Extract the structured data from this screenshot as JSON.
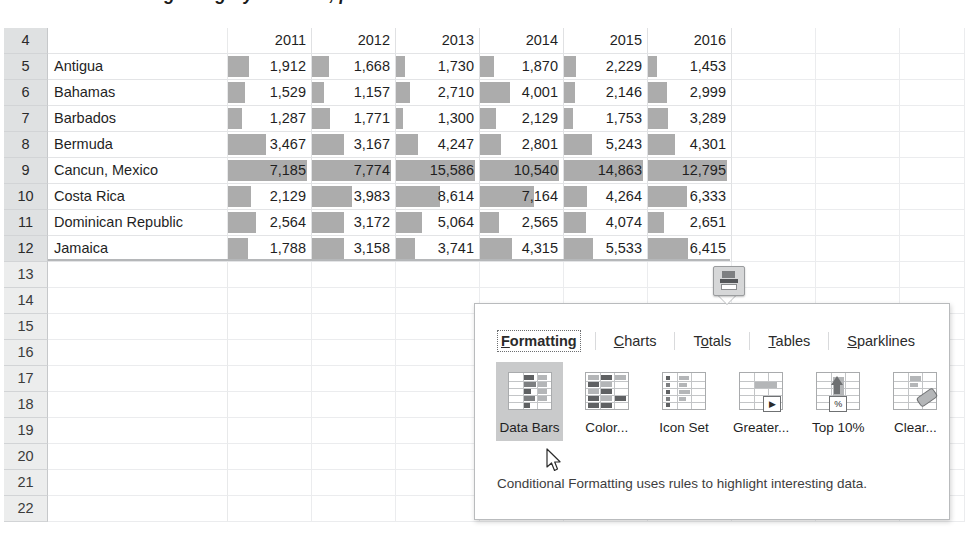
{
  "document": {
    "cut_off_heading": "With the Formatting category selected, point to the Data Bars conditional formatt"
  },
  "sheet": {
    "row_numbers": [
      "4",
      "5",
      "6",
      "7",
      "8",
      "9",
      "10",
      "11",
      "12",
      "13",
      "14",
      "15",
      "16",
      "17",
      "18",
      "19",
      "20",
      "21",
      "22"
    ],
    "selected_rows": [
      "4",
      "5",
      "6",
      "7",
      "8",
      "9",
      "10",
      "11",
      "12"
    ],
    "column_headers": [
      "2011",
      "2012",
      "2013",
      "2014",
      "2015",
      "2016"
    ],
    "blank_corner": "",
    "rows": [
      {
        "label": "Antigua",
        "values": [
          "1,912",
          "1,668",
          "1,730",
          "1,870",
          "2,229",
          "1,453"
        ]
      },
      {
        "label": "Bahamas",
        "values": [
          "1,529",
          "1,157",
          "2,710",
          "4,001",
          "2,146",
          "2,999"
        ]
      },
      {
        "label": "Barbados",
        "values": [
          "1,287",
          "1,771",
          "1,300",
          "2,129",
          "1,753",
          "3,289"
        ]
      },
      {
        "label": "Bermuda",
        "values": [
          "3,467",
          "3,167",
          "4,247",
          "2,801",
          "5,243",
          "4,301"
        ]
      },
      {
        "label": "Cancun, Mexico",
        "values": [
          "7,185",
          "7,774",
          "15,586",
          "10,540",
          "14,863",
          "12,795"
        ]
      },
      {
        "label": "Costa Rica",
        "values": [
          "2,129",
          "3,983",
          "8,614",
          "7,164",
          "4,264",
          "6,333"
        ]
      },
      {
        "label": "Dominican Republic",
        "values": [
          "2,564",
          "3,172",
          "5,064",
          "2,565",
          "4,074",
          "2,651"
        ]
      },
      {
        "label": "Jamaica",
        "values": [
          "1,788",
          "3,158",
          "3,741",
          "4,315",
          "5,533",
          "6,415"
        ]
      }
    ]
  },
  "chart_data": {
    "type": "bar",
    "xlabel": "",
    "ylabel": "",
    "categories": [
      "Antigua",
      "Bahamas",
      "Barbados",
      "Bermuda",
      "Cancun, Mexico",
      "Costa Rica",
      "Dominican Republic",
      "Jamaica"
    ],
    "series": [
      {
        "name": "2011",
        "values": [
          1912,
          1529,
          1287,
          3467,
          7185,
          2129,
          2564,
          1788
        ]
      },
      {
        "name": "2012",
        "values": [
          1668,
          1157,
          1771,
          3167,
          7774,
          3983,
          3172,
          3158
        ]
      },
      {
        "name": "2013",
        "values": [
          1730,
          2710,
          1300,
          4247,
          15586,
          8614,
          5064,
          3741
        ]
      },
      {
        "name": "2014",
        "values": [
          1870,
          4001,
          2129,
          2801,
          10540,
          7164,
          2565,
          4315
        ]
      },
      {
        "name": "2015",
        "values": [
          2229,
          2146,
          1753,
          5243,
          14863,
          4264,
          4074,
          5533
        ]
      },
      {
        "name": "2016",
        "values": [
          1453,
          2999,
          3289,
          4301,
          12795,
          6333,
          2651,
          6415
        ]
      }
    ],
    "bar_color": "#9a9a9a",
    "grid": true,
    "legend": "none"
  },
  "quick_analysis": {
    "button_icon": "quick-analysis-icon",
    "tabs": [
      {
        "label": "Formatting",
        "accel": "F",
        "active": true
      },
      {
        "label": "Charts",
        "accel": "C",
        "active": false
      },
      {
        "label": "Totals",
        "accel": "o",
        "active": false
      },
      {
        "label": "Tables",
        "accel": "T",
        "active": false
      },
      {
        "label": "Sparklines",
        "accel": "S",
        "active": false
      }
    ],
    "gallery": [
      {
        "label": "Data Bars",
        "icon": "data-bars-icon",
        "selected": true
      },
      {
        "label": "Color...",
        "icon": "color-scale-icon",
        "selected": false
      },
      {
        "label": "Icon Set",
        "icon": "icon-set-icon",
        "selected": false
      },
      {
        "label": "Greater...",
        "icon": "greater-than-icon",
        "selected": false
      },
      {
        "label": "Top 10%",
        "icon": "top-ten-percent-icon",
        "selected": false
      },
      {
        "label": "Clear...",
        "icon": "clear-format-icon",
        "selected": false
      }
    ],
    "tip": "Conditional Formatting uses rules to highlight interesting data."
  }
}
